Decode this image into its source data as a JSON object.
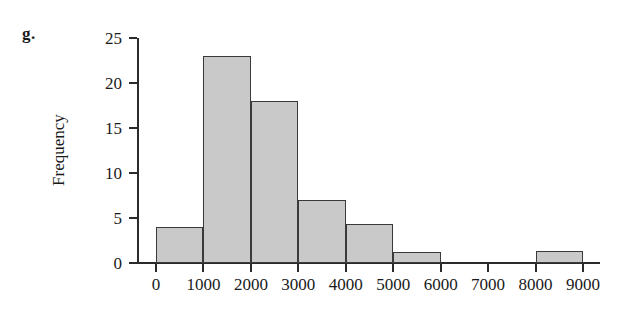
{
  "figure": {
    "panel_label": "g."
  },
  "chart_data": {
    "type": "bar",
    "title": "",
    "xlabel": "",
    "ylabel": "Frequency",
    "grid": false,
    "legend": false,
    "xlim": [
      0,
      9000
    ],
    "ylim": [
      0,
      25
    ],
    "x_tick_labels": [
      "0",
      "1000",
      "2000",
      "3000",
      "4000",
      "5000",
      "6000",
      "7000",
      "8000",
      "9000"
    ],
    "x_tick_values": [
      0,
      1000,
      2000,
      3000,
      4000,
      5000,
      6000,
      7000,
      8000,
      9000
    ],
    "y_tick_labels": [
      "0",
      "5",
      "10",
      "15",
      "20",
      "25"
    ],
    "y_tick_values": [
      0,
      5,
      10,
      15,
      20,
      25
    ],
    "bin_width": 1000,
    "bins": [
      {
        "range": "0-1000",
        "start": 0,
        "end": 1000,
        "value": 4
      },
      {
        "range": "1000-2000",
        "start": 1000,
        "end": 2000,
        "value": 23
      },
      {
        "range": "2000-3000",
        "start": 2000,
        "end": 3000,
        "value": 18
      },
      {
        "range": "3000-4000",
        "start": 3000,
        "end": 4000,
        "value": 7
      },
      {
        "range": "4000-5000",
        "start": 4000,
        "end": 5000,
        "value": 4.3
      },
      {
        "range": "5000-6000",
        "start": 5000,
        "end": 6000,
        "value": 1.2
      },
      {
        "range": "6000-7000",
        "start": 6000,
        "end": 7000,
        "value": 0
      },
      {
        "range": "7000-8000",
        "start": 7000,
        "end": 8000,
        "value": 0
      },
      {
        "range": "8000-9000",
        "start": 8000,
        "end": 9000,
        "value": 1.3
      }
    ],
    "categories": [
      "0-1000",
      "1000-2000",
      "2000-3000",
      "3000-4000",
      "4000-5000",
      "5000-6000",
      "6000-7000",
      "7000-8000",
      "8000-9000"
    ],
    "values": [
      4,
      23,
      18,
      7,
      4.3,
      1.2,
      0,
      0,
      1.3
    ],
    "colors": {
      "bar_fill": "#c9c9c9",
      "bar_edge": "#3a3a3a",
      "axis": "#2b2b2b",
      "text": "#1a1a1a",
      "background": "#ffffff"
    }
  }
}
